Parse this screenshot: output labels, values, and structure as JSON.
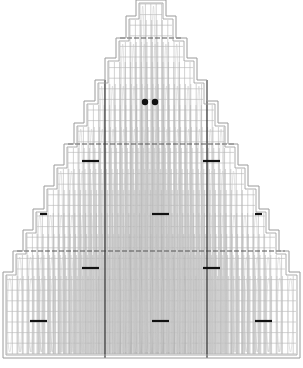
{
  "diagram": {
    "type": "knitting-chart-triangle",
    "width": 303,
    "height": 368,
    "colors": {
      "background": "#ffffff",
      "outline": "#9a9a9a",
      "grid": "#b5b5b5",
      "stitch": "#c8c8c8",
      "dash_line": "#555555",
      "center_line": "#333333",
      "marker": "#111111"
    },
    "grid": {
      "col_width": 5.4,
      "row_height": 10.6
    },
    "steps": [
      {
        "left": 136,
        "right": 166,
        "top": 0
      },
      {
        "left": 126,
        "right": 176,
        "top": 16
      },
      {
        "left": 116,
        "right": 187,
        "top": 38
      },
      {
        "left": 105,
        "right": 197,
        "top": 58
      },
      {
        "left": 95,
        "right": 207,
        "top": 80
      },
      {
        "left": 84,
        "right": 218,
        "top": 101
      },
      {
        "left": 74,
        "right": 228,
        "top": 123
      },
      {
        "left": 64,
        "right": 238,
        "top": 144
      },
      {
        "left": 54,
        "right": 248,
        "top": 165
      },
      {
        "left": 44,
        "right": 259,
        "top": 186
      },
      {
        "left": 33,
        "right": 269,
        "top": 209
      },
      {
        "left": 23,
        "right": 279,
        "top": 230
      },
      {
        "left": 13,
        "right": 289,
        "top": 251
      },
      {
        "left": 3,
        "right": 300,
        "top": 272
      }
    ],
    "bottom": 358,
    "dashed_rows": [
      38,
      144,
      251
    ],
    "center_lines": [
      {
        "x": 105,
        "y1": 80,
        "y2": 358
      },
      {
        "x": 207,
        "y1": 80,
        "y2": 358
      }
    ],
    "dots": [
      {
        "x": 145,
        "y": 102
      },
      {
        "x": 155,
        "y": 102
      }
    ],
    "bars": [
      {
        "x1": 82,
        "x2": 99,
        "y": 161
      },
      {
        "x1": 203,
        "x2": 220,
        "y": 161
      },
      {
        "x1": 40,
        "x2": 47,
        "y": 214
      },
      {
        "x1": 152,
        "x2": 169,
        "y": 214
      },
      {
        "x1": 255,
        "x2": 262,
        "y": 214
      },
      {
        "x1": 82,
        "x2": 99,
        "y": 268
      },
      {
        "x1": 203,
        "x2": 220,
        "y": 268
      },
      {
        "x1": 30,
        "x2": 47,
        "y": 321
      },
      {
        "x1": 152,
        "x2": 169,
        "y": 321
      },
      {
        "x1": 255,
        "x2": 272,
        "y": 321
      }
    ]
  }
}
